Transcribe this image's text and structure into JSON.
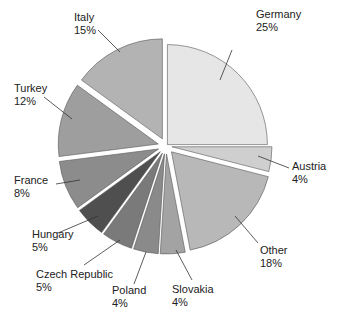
{
  "chart_data": {
    "type": "pie",
    "title": "",
    "center": [
      166,
      146
    ],
    "radius": 100,
    "start_angle_deg": 0,
    "direction": "clockwise",
    "slices": [
      {
        "label": "Germany",
        "pct_label": "25%",
        "value": 25,
        "color": "#e6e6e6",
        "explode": 2,
        "label_pos": [
          256,
          8
        ],
        "leader": [
          [
            232,
            50
          ],
          [
            220,
            80
          ]
        ]
      },
      {
        "label": "Austria",
        "pct_label": "4%",
        "value": 4,
        "color": "#cfcfcf",
        "explode": 6,
        "label_pos": [
          292,
          160
        ],
        "leader": [
          [
            289,
            168
          ],
          [
            258,
            156
          ]
        ]
      },
      {
        "label": "Other",
        "pct_label": "18%",
        "value": 18,
        "color": "#b8b8b8",
        "explode": 8,
        "label_pos": [
          260,
          244
        ],
        "leader": [
          [
            258,
            243
          ],
          [
            235,
            216
          ]
        ]
      },
      {
        "label": "Slovakia",
        "pct_label": "4%",
        "value": 4,
        "color": "#a3a3a3",
        "explode": 8,
        "label_pos": [
          172,
          283
        ],
        "leader": [
          [
            192,
            280
          ],
          [
            176,
            250
          ]
        ]
      },
      {
        "label": "Poland",
        "pct_label": "4%",
        "value": 4,
        "color": "#8a8a8a",
        "explode": 8,
        "label_pos": [
          112,
          284
        ],
        "leader": [
          [
            134,
            284
          ],
          [
            146,
            252
          ]
        ]
      },
      {
        "label": "Czech Republic",
        "pct_label": "5%",
        "value": 5,
        "color": "#7a7a7a",
        "explode": 8,
        "label_pos": [
          36,
          268
        ],
        "leader": [
          [
            84,
            265
          ],
          [
            120,
            240
          ]
        ]
      },
      {
        "label": "Hungary",
        "pct_label": "5%",
        "value": 5,
        "color": "#4f4f4f",
        "explode": 8,
        "label_pos": [
          32,
          228
        ],
        "leader": [
          [
            58,
            233
          ],
          [
            98,
            216
          ]
        ]
      },
      {
        "label": "France",
        "pct_label": "8%",
        "value": 8,
        "color": "#8c8c8c",
        "explode": 8,
        "label_pos": [
          14,
          174
        ],
        "leader": [
          [
            56,
            184
          ],
          [
            80,
            180
          ]
        ]
      },
      {
        "label": "Turkey",
        "pct_label": "12%",
        "value": 12,
        "color": "#9e9e9e",
        "explode": 8,
        "label_pos": [
          14,
          82
        ],
        "leader": [
          [
            44,
            97
          ],
          [
            72,
            119
          ]
        ]
      },
      {
        "label": "Italy",
        "pct_label": "15%",
        "value": 15,
        "color": "#b3b3b3",
        "explode": 8,
        "label_pos": [
          74,
          11
        ],
        "leader": [
          [
            98,
            30
          ],
          [
            120,
            52
          ]
        ]
      }
    ]
  }
}
